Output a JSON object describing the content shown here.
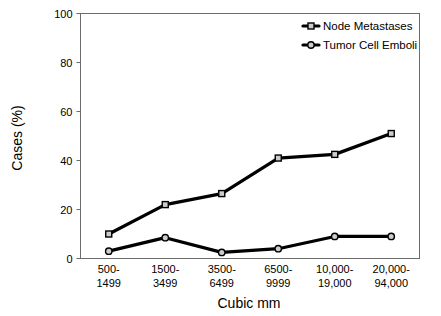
{
  "chart_data": {
    "type": "line",
    "title": "",
    "xlabel": "Cubic mm",
    "ylabel": "Cases (%)",
    "ylim": [
      0,
      100
    ],
    "yticks": [
      0,
      20,
      40,
      60,
      80,
      100
    ],
    "grid": false,
    "legend_position": "top-right",
    "categories": [
      "500-\n1499",
      "1500-\n3499",
      "3500-\n6499",
      "6500-\n9999",
      "10,000-\n19,000",
      "20,000-\n94,000"
    ],
    "category_lines": [
      [
        "500-",
        "1499"
      ],
      [
        "1500-",
        "3499"
      ],
      [
        "3500-",
        "6499"
      ],
      [
        "6500-",
        "9999"
      ],
      [
        "10,000-",
        "19,000"
      ],
      [
        "20,000-",
        "94,000"
      ]
    ],
    "series": [
      {
        "name": "Node Metastases",
        "marker": "square",
        "color": "#000000",
        "values": [
          10,
          22,
          26.5,
          41,
          42.5,
          51
        ]
      },
      {
        "name": "Tumor Cell Emboli",
        "marker": "circle",
        "color": "#000000",
        "values": [
          3,
          8.5,
          2.5,
          4,
          9,
          9
        ]
      }
    ]
  },
  "axis": {
    "y_tick_labels": [
      "100",
      "80",
      "60",
      "40",
      "20",
      "0"
    ],
    "y_title": "Cases (%)",
    "x_title": "Cubic mm"
  },
  "legend": {
    "items": [
      {
        "label": "Node Metastases",
        "marker": "square"
      },
      {
        "label": "Tumor Cell Emboli",
        "marker": "circle"
      }
    ]
  },
  "colors": {
    "line": "#000000",
    "frame": "#6b6b6b",
    "marker_fill": "#cccccc",
    "background": "#ffffff"
  }
}
